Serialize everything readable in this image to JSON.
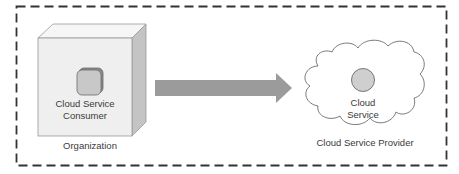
{
  "diagram": {
    "organization": {
      "label": "Organization",
      "consumer_label_line1": "Cloud Service",
      "consumer_label_line2": "Consumer"
    },
    "provider": {
      "label": "Cloud Service Provider",
      "service_label_line1": "Cloud",
      "service_label_line2": "Service"
    },
    "colors": {
      "border": "#333333",
      "cube_front": "#efefef",
      "cube_top": "#f6f6f6",
      "cube_side": "#c4c4c4",
      "arrow": "#9b9b9b",
      "icon": "#c8c8c8",
      "circle": "#cfcfcf",
      "text": "#3a3a3a"
    }
  }
}
